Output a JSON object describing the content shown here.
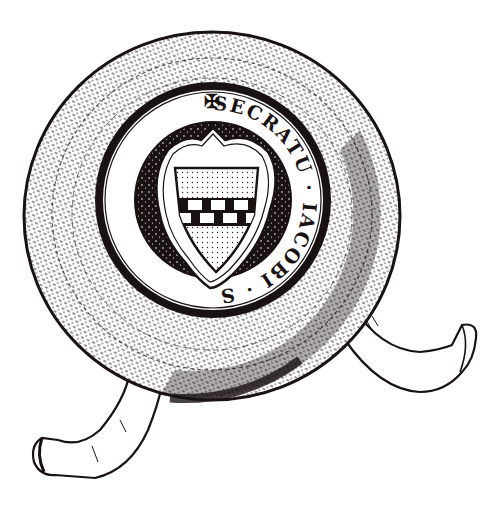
{
  "image": {
    "subject": "Engraved illustration of a medieval wax seal with two parchment tags",
    "style": "black-and-white line engraving",
    "colors": {
      "ink": "#1a1212",
      "paper": "#ffffff",
      "field_dots": "#2a2020"
    }
  },
  "seal": {
    "shape": "round",
    "inscription": {
      "start_mark": "✠",
      "text": "SECRATU · IACOBI · SCABINI · FILII · SCOPIA",
      "segments": [
        "SECRATU",
        "IACOBI",
        "SCABINI",
        "FILII",
        "SCOPIA"
      ],
      "direction": "clockwise from top cross",
      "lettering": "Gothic majuscule"
    },
    "shield": {
      "outline": "heater shield set within a cusped (heart-shaped) border with a point at the top",
      "charges": "a fess chequy of two rows across the shield, upper and lower fields dotted (stippled)",
      "chequy_rows": 2,
      "chequy_columns": 5
    }
  },
  "tags": [
    {
      "name": "left-tag",
      "position": "lower-left",
      "description": "curled parchment tag emerging below the seal"
    },
    {
      "name": "right-tag",
      "position": "lower-right",
      "description": "curled parchment tag emerging at right of seal"
    }
  ]
}
